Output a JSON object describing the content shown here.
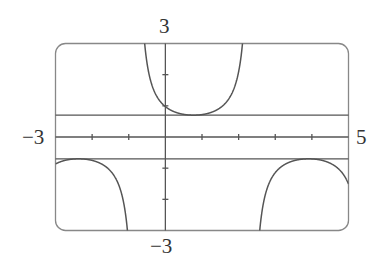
{
  "chart_data": {
    "type": "line",
    "title": "",
    "xlabel": "",
    "ylabel": "",
    "xlim": [
      -3,
      5
    ],
    "ylim": [
      -3,
      3
    ],
    "x_tick_step": 1,
    "y_tick_step": 1,
    "grid": false,
    "tick_labels": {
      "x_min": "−3",
      "x_max": "5",
      "y_max": "3",
      "y_min": "−3"
    },
    "series": [
      {
        "name": "y = 0.7 sec(x − 0.77)",
        "function": "0.7/cos(x-0.77)",
        "amplitude": 0.7,
        "phase_shift": 0.77,
        "sample_points": [
          {
            "x": -3,
            "y": -0.87
          },
          {
            "x": -2.37,
            "y": -0.7
          },
          {
            "x": -1.5,
            "y": -1.1
          },
          {
            "x": 0,
            "y": 0.98
          },
          {
            "x": 0.77,
            "y": 0.7
          },
          {
            "x": 1.5,
            "y": 0.94
          },
          {
            "x": 3.9,
            "y": -0.7
          },
          {
            "x": 5,
            "y": -1.5
          }
        ]
      },
      {
        "name": "y = 0.7",
        "constant": 0.7
      },
      {
        "name": "y = -0.7",
        "constant": -0.7
      }
    ],
    "colors": {
      "curve": "#555555",
      "frame": "#777777",
      "axis": "#555555"
    }
  }
}
